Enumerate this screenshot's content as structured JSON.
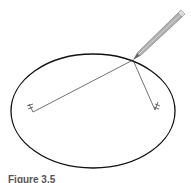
{
  "figure": {
    "caption": "Figure 3.5",
    "ellipse": {
      "cx": 93,
      "cy": 111,
      "rx": 82,
      "ry": 57,
      "stroke": "#111111"
    },
    "pins": [
      {
        "name": "left-pin",
        "x": 32,
        "y": 112
      },
      {
        "name": "right-pin",
        "x": 155,
        "y": 110
      }
    ],
    "string_vertex": {
      "x": 133,
      "y": 60
    },
    "pencil": {
      "tip": [
        133,
        60
      ],
      "end": [
        181,
        14
      ],
      "color": "#9a9a9a"
    }
  }
}
